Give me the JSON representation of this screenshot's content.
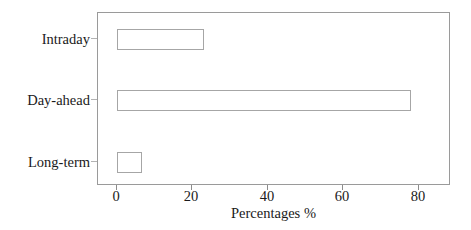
{
  "chart_data": {
    "type": "bar",
    "orientation": "horizontal",
    "title": "",
    "xlabel": "Percentages %",
    "ylabel": "",
    "categories": [
      "Intraday",
      "Day-ahead",
      "Long-term"
    ],
    "values": [
      23,
      78,
      6.5
    ],
    "series": [
      {
        "name": "Percentages",
        "values": [
          23,
          78,
          6.5
        ]
      }
    ],
    "xlim": [
      -4.2,
      88.5
    ],
    "ylim": [
      0,
      3
    ],
    "xticks": [
      0,
      20,
      40,
      60,
      80
    ],
    "xtick_labels": [
      "0",
      "20",
      "40",
      "60",
      "80"
    ],
    "ytick_labels": [
      "Intraday",
      "Day-ahead",
      "Long-term"
    ],
    "grid": false,
    "legend": null,
    "bar_facecolor": "#ffffff",
    "bar_edgecolor": "#a6a6a6",
    "axes_edgecolor": "#9a9a9a",
    "background": "#ffffff"
  },
  "axis": {
    "x_title": "Percentages %",
    "tick_0": "0",
    "tick_20": "20",
    "tick_40": "40",
    "tick_60": "60",
    "tick_80": "80"
  },
  "categories": {
    "intraday": "Intraday",
    "day_ahead": "Day-ahead",
    "long_term": "Long-term"
  }
}
